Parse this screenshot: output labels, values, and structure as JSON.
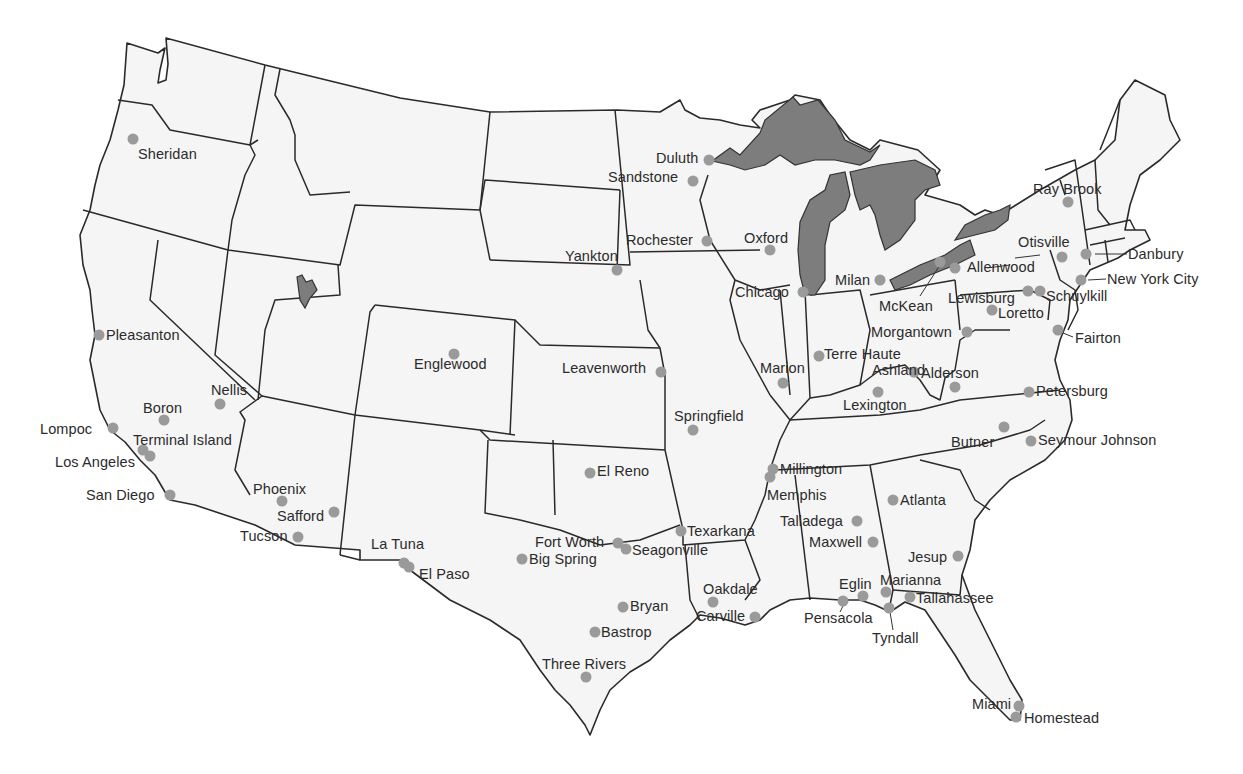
{
  "map": {
    "title": "",
    "region": "Contiguous United States",
    "colors": {
      "land": "#f5f5f5",
      "border": "#2a2a2a",
      "lakes": "#7d7d7d",
      "dot": "#9a9a9a",
      "label": "#2b2b2b"
    },
    "locations": [
      {
        "name": "Sheridan",
        "dot": [
          133,
          139
        ],
        "label": [
          138,
          147
        ]
      },
      {
        "name": "Pleasanton",
        "dot": [
          99,
          335
        ],
        "label": [
          106,
          328
        ]
      },
      {
        "name": "Nellis",
        "dot": [
          220,
          404
        ],
        "label": [
          211,
          383
        ]
      },
      {
        "name": "Boron",
        "dot": [
          164,
          420
        ],
        "label": [
          143,
          401
        ]
      },
      {
        "name": "Lompoc",
        "dot": [
          113,
          428
        ],
        "label": [
          40,
          422
        ]
      },
      {
        "name": "Terminal Island",
        "dot": [
          150,
          456
        ],
        "label": [
          133,
          433
        ]
      },
      {
        "name": "Los Angeles",
        "dot": [
          143,
          450
        ],
        "label": [
          55,
          455
        ]
      },
      {
        "name": "San Diego",
        "dot": [
          170,
          495
        ],
        "label": [
          86,
          488
        ]
      },
      {
        "name": "Phoenix",
        "dot": [
          282,
          501
        ],
        "label": [
          253,
          482
        ]
      },
      {
        "name": "Safford",
        "dot": [
          334,
          512
        ],
        "label": [
          277,
          509
        ]
      },
      {
        "name": "Tucson",
        "dot": [
          298,
          537
        ],
        "label": [
          240,
          529
        ]
      },
      {
        "name": "Englewood",
        "dot": [
          454,
          354
        ],
        "label": [
          414,
          357
        ]
      },
      {
        "name": "La Tuna",
        "dot": [
          404,
          563
        ],
        "label": [
          371,
          537
        ]
      },
      {
        "name": "El Paso",
        "dot": [
          409,
          567
        ],
        "label": [
          419,
          567
        ]
      },
      {
        "name": "Yankton",
        "dot": [
          617,
          270
        ],
        "label": [
          565,
          249
        ]
      },
      {
        "name": "Leavenworth",
        "dot": [
          661,
          372
        ],
        "label": [
          562,
          361
        ]
      },
      {
        "name": "Duluth",
        "dot": [
          709,
          160
        ],
        "label": [
          656,
          151
        ]
      },
      {
        "name": "Sandstone",
        "dot": [
          693,
          181
        ],
        "label": [
          608,
          170
        ]
      },
      {
        "name": "Rochester",
        "dot": [
          707,
          241
        ],
        "label": [
          626,
          233
        ]
      },
      {
        "name": "Oxford",
        "dot": [
          770,
          250
        ],
        "label": [
          744,
          231
        ]
      },
      {
        "name": "Chicago",
        "dot": [
          803,
          292
        ],
        "label": [
          735,
          285
        ]
      },
      {
        "name": "Milan",
        "dot": [
          880,
          280
        ],
        "label": [
          835,
          273
        ]
      },
      {
        "name": "Marion",
        "dot": [
          783,
          383
        ],
        "label": [
          760,
          361
        ]
      },
      {
        "name": "Terre Haute",
        "dot": [
          819,
          356
        ],
        "label": [
          824,
          347
        ]
      },
      {
        "name": "Springfield",
        "dot": [
          693,
          430
        ],
        "label": [
          674,
          409
        ]
      },
      {
        "name": "El Reno",
        "dot": [
          590,
          473
        ],
        "label": [
          597,
          464
        ]
      },
      {
        "name": "Texarkana",
        "dot": [
          681,
          531
        ],
        "label": [
          687,
          524
        ]
      },
      {
        "name": "Fort Worth",
        "dot": [
          618,
          543
        ],
        "label": [
          535,
          535
        ]
      },
      {
        "name": "Seagonville",
        "dot": [
          626,
          549
        ],
        "label": [
          632,
          543
        ]
      },
      {
        "name": "Big Spring",
        "dot": [
          522,
          559
        ],
        "label": [
          529,
          552
        ]
      },
      {
        "name": "Bryan",
        "dot": [
          623,
          607
        ],
        "label": [
          630,
          599
        ]
      },
      {
        "name": "Bastrop",
        "dot": [
          595,
          632
        ],
        "label": [
          601,
          625
        ]
      },
      {
        "name": "Three Rivers",
        "dot": [
          586,
          677
        ],
        "label": [
          542,
          657
        ]
      },
      {
        "name": "Oakdale",
        "dot": [
          713,
          602
        ],
        "label": [
          703,
          582
        ]
      },
      {
        "name": "Carville",
        "dot": [
          755,
          617
        ],
        "label": [
          696,
          609
        ]
      },
      {
        "name": "Millington",
        "dot": [
          773,
          469
        ],
        "label": [
          780,
          462
        ]
      },
      {
        "name": "Memphis",
        "dot": [
          770,
          477
        ],
        "label": [
          767,
          488
        ]
      },
      {
        "name": "Atlanta",
        "dot": [
          893,
          500
        ],
        "label": [
          900,
          493
        ]
      },
      {
        "name": "Talladega",
        "dot": [
          857,
          521
        ],
        "label": [
          780,
          514
        ]
      },
      {
        "name": "Maxwell",
        "dot": [
          873,
          542
        ],
        "label": [
          809,
          535
        ]
      },
      {
        "name": "Jesup",
        "dot": [
          958,
          556
        ],
        "label": [
          908,
          550
        ]
      },
      {
        "name": "Eglin",
        "dot": [
          863,
          596
        ],
        "label": [
          839,
          577
        ]
      },
      {
        "name": "Marianna",
        "dot": [
          886,
          592
        ],
        "label": [
          880,
          573
        ]
      },
      {
        "name": "Tallahassee",
        "dot": [
          910,
          597
        ],
        "label": [
          916,
          591
        ]
      },
      {
        "name": "Pensacola",
        "dot": [
          843,
          601
        ],
        "label": [
          804,
          611
        ]
      },
      {
        "name": "Tyndall",
        "dot": [
          889,
          608
        ],
        "label": [
          872,
          631
        ]
      },
      {
        "name": "Miami",
        "dot": [
          1019,
          706
        ],
        "label": [
          972,
          697
        ]
      },
      {
        "name": "Homestead",
        "dot": [
          1016,
          717
        ],
        "label": [
          1024,
          711
        ]
      },
      {
        "name": "Ray Brook",
        "dot": [
          1068,
          202
        ],
        "label": [
          1033,
          182
        ]
      },
      {
        "name": "Otisville",
        "dot": [
          1062,
          257
        ],
        "label": [
          1018,
          235
        ]
      },
      {
        "name": "Danbury",
        "dot": [
          1086,
          254
        ],
        "label": [
          1128,
          247
        ]
      },
      {
        "name": "New York City",
        "dot": [
          1081,
          280
        ],
        "label": [
          1107,
          272
        ]
      },
      {
        "name": "Allenwood",
        "dot": [
          955,
          268
        ],
        "label": [
          967,
          260
        ]
      },
      {
        "name": "Lewisburg",
        "dot": [
          1028,
          291
        ],
        "label": [
          948,
          291
        ]
      },
      {
        "name": "Schuylkill",
        "dot": [
          1040,
          291
        ],
        "label": [
          1046,
          289
        ]
      },
      {
        "name": "McKean",
        "dot": [
          940,
          262
        ],
        "label": [
          879,
          299
        ]
      },
      {
        "name": "Loretto",
        "dot": [
          992,
          310
        ],
        "label": [
          998,
          306
        ]
      },
      {
        "name": "Morgantown",
        "dot": [
          967,
          332
        ],
        "label": [
          871,
          325
        ]
      },
      {
        "name": "Fairton",
        "dot": [
          1058,
          330
        ],
        "label": [
          1075,
          331
        ]
      },
      {
        "name": "Ashland",
        "dot": [
          914,
          372
        ],
        "label": [
          872,
          363
        ]
      },
      {
        "name": "Alderson",
        "dot": [
          955,
          387
        ],
        "label": [
          921,
          366
        ]
      },
      {
        "name": "Lexington",
        "dot": [
          878,
          392
        ],
        "label": [
          843,
          398
        ]
      },
      {
        "name": "Petersburg",
        "dot": [
          1029,
          392
        ],
        "label": [
          1036,
          384
        ]
      },
      {
        "name": "Butner",
        "dot": [
          1004,
          427
        ],
        "label": [
          951,
          435
        ]
      },
      {
        "name": "Seymour Johnson",
        "dot": [
          1031,
          441
        ],
        "label": [
          1038,
          433
        ]
      }
    ]
  }
}
